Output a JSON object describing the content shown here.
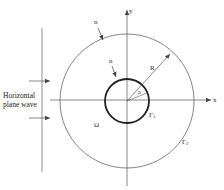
{
  "diagram": {
    "wave_label_line1": "Horizontal",
    "wave_label_line2": "plane wave",
    "axis_x_label": "x",
    "axis_y_label": "y",
    "normal_outer_label": "n",
    "normal_inner_label": "n",
    "outer_radius_label": "R",
    "inner_radius_label": "a",
    "domain_label": "Ω",
    "inner_boundary_label": "Γ",
    "inner_boundary_sub": "1",
    "outer_boundary_label": "Γ",
    "outer_boundary_sub": "2",
    "colors": {
      "line": "#555555",
      "thick_circle": "#222222",
      "background": "#ffffff"
    }
  }
}
